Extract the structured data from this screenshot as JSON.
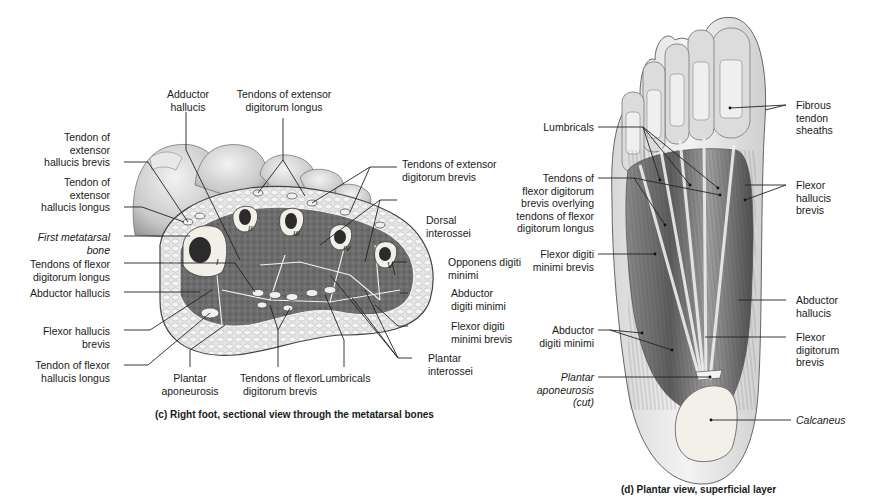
{
  "figure_c": {
    "caption": "(c) Right foot, sectional view through the metatarsal bones",
    "bone_numerals": [
      "I",
      "II",
      "III",
      "IV",
      "V"
    ],
    "labels": {
      "adductor_hallucis": "Adductor\nhallucis",
      "ext_digitorum_longus": "Tendons of extensor\ndigitorum longus",
      "ext_hallucis_brevis": "Tendon of\nextensor\nhallucis brevis",
      "ext_hallucis_longus": "Tendon of\nextensor\nhallucis longus",
      "first_metatarsal": "First metatarsal\nbone",
      "flexor_digitorum_longus": "Tendons of flexor\ndigitorum longus",
      "abductor_hallucis": "Abductor hallucis",
      "flexor_hallucis_brevis": "Flexor hallucis\nbrevis",
      "flexor_hallucis_longus": "Tendon of flexor\nhallucis longus",
      "plantar_aponeurosis": "Plantar\naponeurosis",
      "flexor_digitorum_brevis": "Tendons of flexor\ndigitorum brevis",
      "lumbricals": "Lumbricals",
      "plantar_interossei": "Plantar\ninterossei",
      "flexor_digiti_minimi_brevis": "Flexor digiti\nminimi brevis",
      "abductor_digiti_minimi": "Abductor\ndigiti minimi",
      "opponens_digiti_minimi": "Opponens digiti\nminimi",
      "dorsal_interossei": "Dorsal\ninterossei",
      "ext_digitorum_brevis": "Tendons of extensor\ndigitorum brevis"
    }
  },
  "figure_d": {
    "caption": "(d) Plantar view, superficial layer",
    "labels": {
      "lumbricals": "Lumbricals",
      "fdb_overlying_fdl": "Tendons of\nflexor digitorum\nbrevis overlying\ntendons of flexor\ndigitorum longus",
      "flexor_digiti_minimi_brevis": "Flexor digiti\nminimi brevis",
      "abductor_digiti_minimi": "Abductor\ndigiti minimi",
      "plantar_aponeurosis_cut": "Plantar\naponeurosis\n(cut)",
      "fibrous_tendon_sheaths": "Fibrous\ntendon\nsheaths",
      "flexor_hallucis_brevis": "Flexor\nhallucis\nbrevis",
      "abductor_hallucis": "Abductor\nhallucis",
      "flexor_digitorum_brevis": "Flexor\ndigitorum\nbrevis",
      "calcaneus": "Calcaneus"
    }
  }
}
